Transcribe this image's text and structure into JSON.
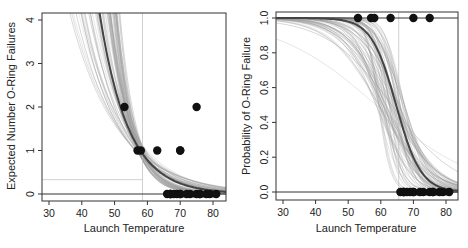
{
  "chart_data": [
    {
      "type": "line",
      "panel": "left",
      "title": "",
      "xlabel": "Launch Temperature",
      "ylabel": "Expected Number O-Ring Failures",
      "xlim": [
        28,
        84
      ],
      "ylim": [
        -0.15,
        4.1
      ],
      "xticks": [
        30,
        40,
        50,
        60,
        70,
        80
      ],
      "yticks": [
        0,
        1,
        2,
        3,
        4
      ],
      "grid": false,
      "legend": null,
      "observed_points": {
        "x": [
          53,
          57,
          58,
          63,
          66,
          67,
          67,
          67,
          68,
          69,
          70,
          70,
          70,
          70,
          72,
          73,
          75,
          75,
          76,
          76,
          78,
          79,
          81
        ],
        "y": [
          2,
          1,
          1,
          1,
          0,
          0,
          0,
          0,
          0,
          0,
          1,
          1,
          0,
          0,
          0,
          0,
          2,
          0,
          0,
          0,
          0,
          0,
          0
        ]
      },
      "fitted_curve": {
        "description": "Poisson regression fit (dark line) with many bootstrap/posterior draws (light gray lines)",
        "x": [
          44,
          48,
          52,
          56,
          60,
          64,
          68,
          72,
          76,
          80,
          84
        ],
        "y": [
          4.1,
          3.0,
          2.15,
          1.5,
          1.0,
          0.68,
          0.46,
          0.31,
          0.21,
          0.14,
          0.1
        ]
      },
      "reference_lines": {
        "vertical_x": 58.5,
        "horizontal_y": 0.33
      }
    },
    {
      "type": "line",
      "panel": "right",
      "title": "",
      "xlabel": "Launch Temperature",
      "ylabel": "Probability of O-Ring Failure",
      "xlim": [
        28,
        84
      ],
      "ylim": [
        -0.05,
        1.05
      ],
      "xticks": [
        30,
        40,
        50,
        60,
        70,
        80
      ],
      "yticks": [
        0.0,
        0.2,
        0.4,
        0.6,
        0.8,
        1.0
      ],
      "grid": false,
      "legend": null,
      "observed_points": {
        "x": [
          53,
          57,
          58,
          63,
          70,
          75,
          66,
          67,
          67,
          67,
          68,
          69,
          70,
          70,
          72,
          73,
          75,
          76,
          76,
          78,
          79,
          81
        ],
        "y": [
          1,
          1,
          1,
          1,
          1,
          1,
          0,
          0,
          0,
          0,
          0,
          0,
          0,
          0,
          0,
          0,
          0,
          0,
          0,
          0,
          0,
          0
        ]
      },
      "fitted_curve": {
        "description": "Logistic regression fit (dark line) with many bootstrap/posterior draws (light gray lines)",
        "x": [
          28,
          40,
          50,
          55,
          60,
          63,
          65,
          67,
          70,
          75,
          80,
          84
        ],
        "y": [
          1.0,
          1.0,
          0.98,
          0.94,
          0.8,
          0.62,
          0.48,
          0.36,
          0.2,
          0.07,
          0.03,
          0.02
        ]
      },
      "reference_lines": {
        "vertical_x": 65.5
      }
    }
  ],
  "left_panel": {
    "xlabel": "Launch Temperature",
    "ylabel": "Expected Number O-Ring Failures",
    "xticks": [
      "30",
      "40",
      "50",
      "60",
      "70",
      "80"
    ],
    "yticks": [
      "0",
      "1",
      "2",
      "3",
      "4"
    ]
  },
  "right_panel": {
    "xlabel": "Launch Temperature",
    "ylabel": "Probability of O-Ring Failure",
    "xticks": [
      "30",
      "40",
      "50",
      "60",
      "70",
      "80"
    ],
    "yticks": [
      "0.0",
      "0.2",
      "0.4",
      "0.6",
      "0.8",
      "1.0"
    ]
  },
  "colors": {
    "fit_line": "#444444",
    "draw_lines": "#9a9a9a",
    "points": "#111111",
    "frame": "#333333"
  }
}
